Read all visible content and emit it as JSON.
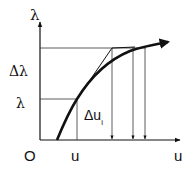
{
  "diagram": {
    "type": "load-displacement curve with tangent iteration",
    "axes": {
      "y_label": "λ",
      "x_label": "u",
      "origin_label": "O"
    },
    "labels": {
      "delta_lambda": "Δλ",
      "lambda": "λ",
      "u": "u",
      "delta_u_prefix": "Δu",
      "delta_u_subscript": "i"
    },
    "colors": {
      "line": "#111111",
      "guide": "#333333",
      "background": "#ffffff"
    }
  }
}
